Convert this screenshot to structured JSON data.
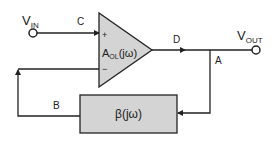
{
  "diagram": {
    "colors": {
      "line": "#222222",
      "block_fill": "#d4d4d4",
      "background": "#ffffff"
    },
    "input": {
      "label_main": "V",
      "label_sub": "IN"
    },
    "output": {
      "label_main": "V",
      "label_sub": "OUT"
    },
    "amplifier": {
      "label_main": "A",
      "label_sub": "OL",
      "label_tail": "(jω)",
      "plus": "+",
      "minus": "−"
    },
    "feedback_block": {
      "label": "β(jω)"
    },
    "nodes": {
      "a": "A",
      "b": "B",
      "c": "C",
      "d": "D"
    }
  }
}
